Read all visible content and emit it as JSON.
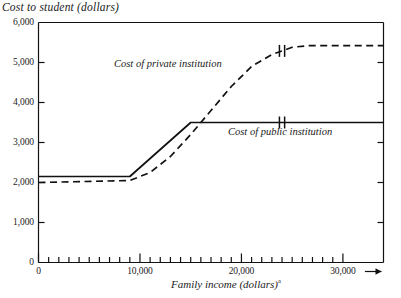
{
  "chart_data": {
    "type": "line",
    "title": "",
    "ylabel": "Cost to student (dollars)",
    "xlabel": "Family income (dollars)",
    "xlabel_footnote": "a",
    "xlim": [
      0,
      34000
    ],
    "ylim": [
      0,
      6000
    ],
    "grid": false,
    "legend_position": "inline-annotations",
    "y_ticks": [
      0,
      1000,
      2000,
      3000,
      4000,
      5000,
      6000
    ],
    "y_tick_labels": [
      "0",
      "1,000",
      "2,000",
      "3,000",
      "4,000",
      "5,000",
      "6,000"
    ],
    "x_ticks": [
      0,
      10000,
      20000,
      30000
    ],
    "x_tick_labels": [
      "0",
      "10,000",
      "20,000",
      "30,000"
    ],
    "x_minor_tick_step": 1000,
    "axis_arrow": true,
    "series": [
      {
        "name": "Cost of public institution",
        "style": "solid",
        "color": "#111111",
        "break_mark_x": 24000,
        "x": [
          0,
          9000,
          15000,
          34000
        ],
        "values": [
          2150,
          2150,
          3500,
          3500
        ]
      },
      {
        "name": "Cost of private institution",
        "style": "dashed",
        "color": "#111111",
        "break_mark_x": 24000,
        "x": [
          0,
          9000,
          11000,
          13000,
          15000,
          17000,
          19000,
          21000,
          23000,
          25000,
          26500,
          34000
        ],
        "values": [
          2000,
          2050,
          2250,
          2650,
          3200,
          3800,
          4400,
          4900,
          5200,
          5380,
          5420,
          5420
        ]
      }
    ],
    "annotations": [
      {
        "text": "Cost of private institution",
        "x": 11000,
        "y": 4900
      },
      {
        "text": "Cost of public institution",
        "x": 25000,
        "y": 3100
      }
    ]
  }
}
